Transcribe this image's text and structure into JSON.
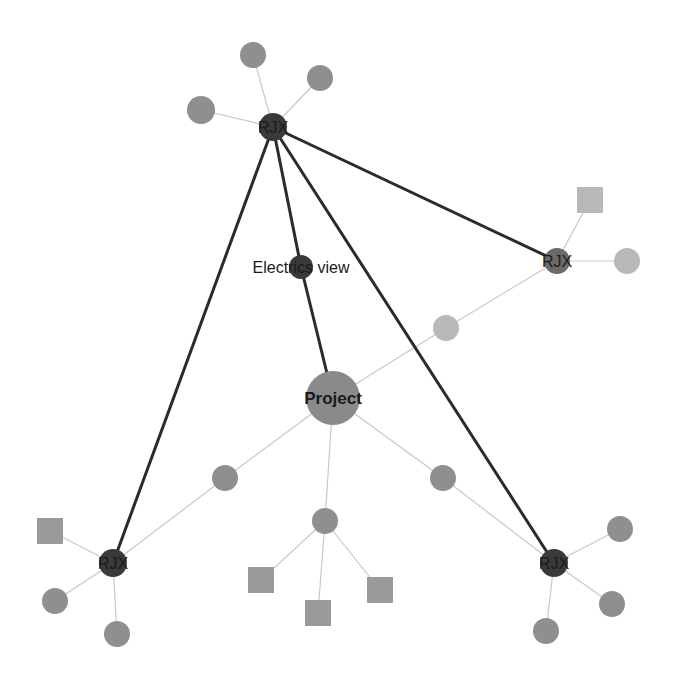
{
  "diagram": {
    "type": "network-graph",
    "colors": {
      "background": "#ffffff",
      "strong_edge": "#2b2b2b",
      "weak_edge": "#c8c8c8",
      "hub_node": "#3a3a3a",
      "project_node": "#8a8a8a",
      "leaf_node": "#8f8f8f",
      "light_node": "#b8b8b8",
      "square_node": "#9a9a9a",
      "light_square": "#b8b8b8"
    },
    "nodes": [
      {
        "id": "rjx-top",
        "label": "RJX",
        "shape": "circle",
        "x": 273,
        "y": 127,
        "r": 14,
        "kind": "hub"
      },
      {
        "id": "rjx-right",
        "label": "RJX",
        "shape": "circle",
        "x": 557,
        "y": 261,
        "r": 13,
        "kind": "hub-mid"
      },
      {
        "id": "rjx-left",
        "label": "RJX",
        "shape": "circle",
        "x": 113,
        "y": 563,
        "r": 14,
        "kind": "hub"
      },
      {
        "id": "rjx-bottomright",
        "label": "RJX",
        "shape": "circle",
        "x": 554,
        "y": 563,
        "r": 14,
        "kind": "hub"
      },
      {
        "id": "electrics-view",
        "label": "Electrics view",
        "shape": "circle",
        "x": 301,
        "y": 267,
        "r": 12,
        "kind": "hub"
      },
      {
        "id": "project",
        "label": "Project",
        "shape": "circle",
        "x": 333,
        "y": 398,
        "r": 27,
        "kind": "project"
      },
      {
        "id": "top-a",
        "label": "",
        "shape": "circle",
        "x": 253,
        "y": 55,
        "r": 13,
        "kind": "leaf"
      },
      {
        "id": "top-b",
        "label": "",
        "shape": "circle",
        "x": 320,
        "y": 78,
        "r": 13,
        "kind": "leaf"
      },
      {
        "id": "top-c",
        "label": "",
        "shape": "circle",
        "x": 201,
        "y": 110,
        "r": 14,
        "kind": "leaf"
      },
      {
        "id": "right-sq",
        "label": "",
        "shape": "square",
        "x": 590,
        "y": 200,
        "s": 26,
        "kind": "light-square"
      },
      {
        "id": "right-circ",
        "label": "",
        "shape": "circle",
        "x": 627,
        "y": 261,
        "r": 13,
        "kind": "light"
      },
      {
        "id": "mid-light",
        "label": "",
        "shape": "circle",
        "x": 446,
        "y": 328,
        "r": 13,
        "kind": "light"
      },
      {
        "id": "mid-left",
        "label": "",
        "shape": "circle",
        "x": 225,
        "y": 478,
        "r": 13,
        "kind": "leaf"
      },
      {
        "id": "mid-right",
        "label": "",
        "shape": "circle",
        "x": 443,
        "y": 478,
        "r": 13,
        "kind": "leaf"
      },
      {
        "id": "bottom-hub",
        "label": "",
        "shape": "circle",
        "x": 325,
        "y": 521,
        "r": 13,
        "kind": "leaf"
      },
      {
        "id": "bl-sq",
        "label": "",
        "shape": "square",
        "x": 50,
        "y": 531,
        "s": 26,
        "kind": "square"
      },
      {
        "id": "bl-c1",
        "label": "",
        "shape": "circle",
        "x": 55,
        "y": 601,
        "r": 13,
        "kind": "leaf"
      },
      {
        "id": "bl-c2",
        "label": "",
        "shape": "circle",
        "x": 117,
        "y": 634,
        "r": 13,
        "kind": "leaf"
      },
      {
        "id": "bm-sq1",
        "label": "",
        "shape": "square",
        "x": 261,
        "y": 580,
        "s": 26,
        "kind": "square"
      },
      {
        "id": "bm-sq2",
        "label": "",
        "shape": "square",
        "x": 318,
        "y": 613,
        "s": 26,
        "kind": "square"
      },
      {
        "id": "bm-sq3",
        "label": "",
        "shape": "square",
        "x": 380,
        "y": 590,
        "s": 26,
        "kind": "square"
      },
      {
        "id": "br-c1",
        "label": "",
        "shape": "circle",
        "x": 620,
        "y": 529,
        "r": 13,
        "kind": "leaf"
      },
      {
        "id": "br-c2",
        "label": "",
        "shape": "circle",
        "x": 612,
        "y": 604,
        "r": 13,
        "kind": "leaf"
      },
      {
        "id": "br-c3",
        "label": "",
        "shape": "circle",
        "x": 546,
        "y": 631,
        "r": 13,
        "kind": "leaf"
      }
    ],
    "edges": [
      {
        "from": "rjx-top",
        "to": "electrics-view",
        "weight": "strong"
      },
      {
        "from": "electrics-view",
        "to": "project",
        "weight": "strong"
      },
      {
        "from": "rjx-top",
        "to": "rjx-right",
        "weight": "strong"
      },
      {
        "from": "rjx-top",
        "to": "rjx-left",
        "weight": "strong"
      },
      {
        "from": "rjx-top",
        "to": "rjx-bottomright",
        "weight": "strong"
      },
      {
        "from": "rjx-top",
        "to": "top-a",
        "weight": "weak"
      },
      {
        "from": "rjx-top",
        "to": "top-b",
        "weight": "weak"
      },
      {
        "from": "rjx-top",
        "to": "top-c",
        "weight": "weak"
      },
      {
        "from": "rjx-right",
        "to": "right-sq",
        "weight": "weak"
      },
      {
        "from": "rjx-right",
        "to": "right-circ",
        "weight": "weak"
      },
      {
        "from": "rjx-right",
        "to": "mid-light",
        "weight": "weak"
      },
      {
        "from": "mid-light",
        "to": "project",
        "weight": "weak"
      },
      {
        "from": "project",
        "to": "mid-left",
        "weight": "weak"
      },
      {
        "from": "project",
        "to": "mid-right",
        "weight": "weak"
      },
      {
        "from": "project",
        "to": "bottom-hub",
        "weight": "weak"
      },
      {
        "from": "mid-left",
        "to": "rjx-left",
        "weight": "weak"
      },
      {
        "from": "mid-right",
        "to": "rjx-bottomright",
        "weight": "weak"
      },
      {
        "from": "rjx-left",
        "to": "bl-sq",
        "weight": "weak"
      },
      {
        "from": "rjx-left",
        "to": "bl-c1",
        "weight": "weak"
      },
      {
        "from": "rjx-left",
        "to": "bl-c2",
        "weight": "weak"
      },
      {
        "from": "bottom-hub",
        "to": "bm-sq1",
        "weight": "weak"
      },
      {
        "from": "bottom-hub",
        "to": "bm-sq2",
        "weight": "weak"
      },
      {
        "from": "bottom-hub",
        "to": "bm-sq3",
        "weight": "weak"
      },
      {
        "from": "rjx-bottomright",
        "to": "br-c1",
        "weight": "weak"
      },
      {
        "from": "rjx-bottomright",
        "to": "br-c2",
        "weight": "weak"
      },
      {
        "from": "rjx-bottomright",
        "to": "br-c3",
        "weight": "weak"
      }
    ]
  }
}
